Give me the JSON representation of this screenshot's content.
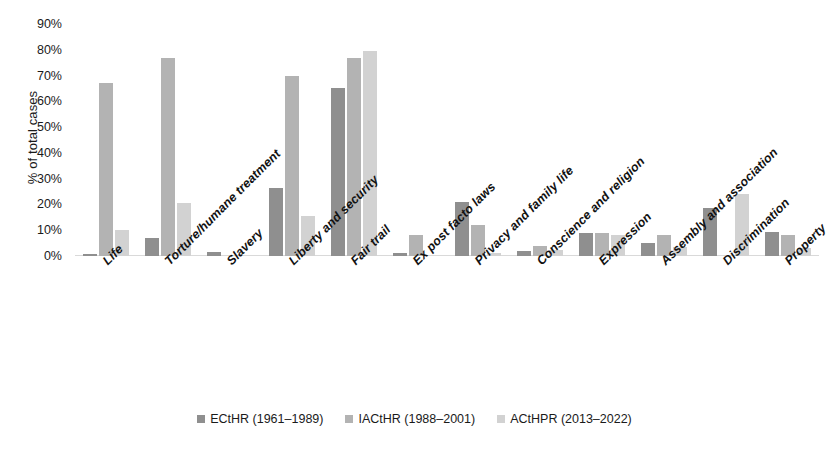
{
  "chart_data": {
    "type": "bar",
    "title": "",
    "xlabel": "",
    "ylabel": "% of total cases",
    "ylim": [
      0,
      90
    ],
    "ytick_labels": [
      "90%",
      "80%",
      "70%",
      "60%",
      "50%",
      "40%",
      "30%",
      "20%",
      "10%",
      "0%"
    ],
    "ytick_values": [
      90,
      80,
      70,
      60,
      50,
      40,
      30,
      20,
      10,
      0
    ],
    "grid": false,
    "legend_position": "bottom",
    "categories": [
      "Life",
      "Torture/humane treatment",
      "Slavery",
      "Liberty and security",
      "Fair trail",
      "Ex post facto laws",
      "Privacy and family life",
      "Conscience and religion",
      "Expression",
      "Assembly and association",
      "Discrimination",
      "Property"
    ],
    "series": [
      {
        "name": "ECtHR (1961–1989)",
        "color": "#8f8f8f",
        "values": [
          0.7,
          7,
          1.5,
          26.5,
          65,
          1,
          21,
          2,
          9,
          5,
          18.5,
          9.5
        ]
      },
      {
        "name": "IACtHR (1988–2001)",
        "color": "#b3b3b3",
        "values": [
          67,
          77,
          0,
          70,
          77,
          8,
          12,
          4,
          9,
          8,
          0,
          8
        ]
      },
      {
        "name": "ACtHPR (2013–2022)",
        "color": "#d2d2d2",
        "values": [
          10,
          20.5,
          0,
          15.5,
          79.5,
          0,
          1,
          2.5,
          8,
          3.5,
          24,
          3
        ]
      }
    ]
  },
  "legend": {
    "items": [
      {
        "label": "ECtHR (1961–1989)",
        "color": "#8f8f8f"
      },
      {
        "label": "IACtHR (1988–2001)",
        "color": "#b3b3b3"
      },
      {
        "label": "ACtHPR (2013–2022)",
        "color": "#d2d2d2"
      }
    ]
  }
}
